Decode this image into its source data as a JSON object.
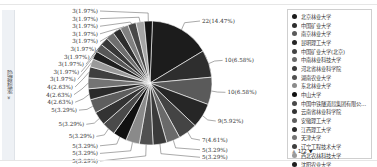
{
  "sidebar": {
    "label": "隐藏检索 »"
  },
  "chart_data": {
    "type": "pie",
    "title": "",
    "total": 152,
    "series": [
      {
        "name": "北京林业大学",
        "value": 22,
        "label": "22(14.47%)",
        "color": "#1c1c1c"
      },
      {
        "name": "中国矿业大学",
        "value": 10,
        "label": "10(6.58%)",
        "color": "#2e2e2e"
      },
      {
        "name": "南京林业大学",
        "value": 10,
        "label": "10(6.58%)",
        "color": "#5a5a5a"
      },
      {
        "name": "昆明理工大学",
        "value": 9,
        "label": "9(5.92%)",
        "color": "#262626"
      },
      {
        "name": "中国矿业大学(北京)",
        "value": 7,
        "label": "7(4.61%)",
        "color": "#444444"
      },
      {
        "name": "中南林业科技大学",
        "value": 5,
        "label": "5(3.29%)",
        "color": "#6a6a6a"
      },
      {
        "name": "河北省林业科学院",
        "value": 5,
        "label": "5(3.29%)",
        "color": "#3a3a3a"
      },
      {
        "name": "湖南农业大学",
        "value": 5,
        "label": "5(3.29%)",
        "color": "#505050"
      },
      {
        "name": "东北林业大学",
        "value": 5,
        "label": "5(3.29%)",
        "color": "#8a8a8a"
      },
      {
        "name": "中山大学",
        "value": 5,
        "label": "5(3.29%)",
        "color": "#111111"
      },
      {
        "name": "中国中铁隧道局集团有限公司",
        "value": 5,
        "label": "5(3.29%)",
        "color": "#4a4a4a"
      },
      {
        "name": "云南省林业科学院",
        "value": 5,
        "label": "5(3.29%)",
        "color": "#333333"
      },
      {
        "name": "安徽理工大学",
        "value": 5,
        "label": "5(3.29%)",
        "color": "#5e5e5e"
      },
      {
        "name": "江西理工大学",
        "value": 4,
        "label": "4(2.63%)",
        "color": "#2a2a2a"
      },
      {
        "name": "天津大学",
        "value": 4,
        "label": "4(2.63%)",
        "color": "#747474"
      },
      {
        "name": "辽宁工程技术大学",
        "value": 4,
        "label": "4(2.63%)",
        "color": "#3f3f3f"
      },
      {
        "name": "西北农林科技大学",
        "value": 3,
        "label": "3(1.97%)",
        "color": "#9a9a9a"
      },
      {
        "name": "沈阳农业大学",
        "value": 3,
        "label": "3(1.97%)",
        "color": "#1f1f1f"
      },
      {
        "name": "其他1",
        "value": 3,
        "label": "3(1.97%)",
        "color": "#575757"
      },
      {
        "name": "其他2",
        "value": 3,
        "label": "3(1.97%)",
        "color": "#383838"
      },
      {
        "name": "其他3",
        "value": 3,
        "label": "3(1.97%)",
        "color": "#6e6e6e"
      },
      {
        "name": "其他4",
        "value": 3,
        "label": "3(1.97%)",
        "color": "#2c2c2c"
      },
      {
        "name": "其他5",
        "value": 3,
        "label": "3(1.97%)",
        "color": "#808080"
      },
      {
        "name": "其他6",
        "value": 3,
        "label": "3(1.97%)",
        "color": "#474747"
      },
      {
        "name": "其他7",
        "value": 3,
        "label": "3(1.97%)",
        "color": "#a5a5a5"
      },
      {
        "name": "其他8",
        "value": 3,
        "label": "3(1.97%)",
        "color": "#151515"
      }
    ],
    "legend_position": "right"
  },
  "legend": {
    "items": [
      {
        "label": "北京林业大学",
        "color": "#1c1c1c"
      },
      {
        "label": "中国矿业大学",
        "color": "#2e2e2e"
      },
      {
        "label": "南京林业大学",
        "color": "#5a5a5a"
      },
      {
        "label": "昆明理工大学",
        "color": "#262626"
      },
      {
        "label": "中国矿业大学(北京)",
        "color": "#444444"
      },
      {
        "label": "中南林业科技大学",
        "color": "#6a6a6a"
      },
      {
        "label": "河北省林业科学院",
        "color": "#3a3a3a"
      },
      {
        "label": "湖南农业大学",
        "color": "#505050"
      },
      {
        "label": "东北林业大学",
        "color": "#8a8a8a"
      },
      {
        "label": "中山大学",
        "color": "#111111"
      },
      {
        "label": "中国中铁隧道局集团有限公司...",
        "color": "#4a4a4a"
      },
      {
        "label": "云南省林业科学院",
        "color": "#333333"
      },
      {
        "label": "安徽理工大学",
        "color": "#5e5e5e"
      },
      {
        "label": "江西理工大学",
        "color": "#2a2a2a"
      },
      {
        "label": "天津大学",
        "color": "#747474"
      },
      {
        "label": "辽宁工程技术大学",
        "color": "#3f3f3f"
      },
      {
        "label": "西北农林科技大学",
        "color": "#9a9a9a"
      },
      {
        "label": "沈阳农业大学",
        "color": "#1f1f1f"
      }
    ],
    "pager": {
      "text": "1/2",
      "prev": "▲",
      "next": "▼"
    }
  }
}
